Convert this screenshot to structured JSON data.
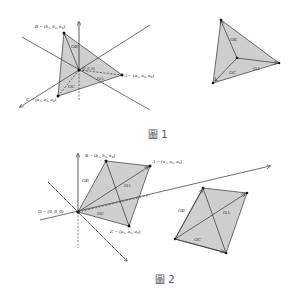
{
  "figure1": {
    "caption": "圖 1",
    "labels": {
      "B": "B = (b₁, b₂, b₃)",
      "A": "A = (a₁, a₂, a₃)",
      "C": "C = (a₁, a₂, a₃)",
      "O": "(0, 0, 0)"
    },
    "vectors": {
      "OA": "OA",
      "OB": "OB",
      "OC": "OC"
    }
  },
  "figure1_detail": {
    "vectors": {
      "OA": "OA",
      "OB": "OB",
      "OC": "OC"
    }
  },
  "figure2": {
    "caption": "圖 2",
    "labels": {
      "B": "B = (b₁, b₂, b₃)",
      "A": "A = (a₁, a₂, a₃)",
      "C": "C = (a₁, a₂, a₃)",
      "O": "O = (0, 0, 0)"
    },
    "vectors": {
      "OA": "OA",
      "OB": "OB",
      "OC": "OC"
    }
  },
  "figure2_detail": {
    "vectors": {
      "OA": "OA",
      "OB": "OB",
      "OC": "OC"
    }
  },
  "colors": {
    "fill": "#cfcfcf",
    "stroke": "#333333"
  }
}
